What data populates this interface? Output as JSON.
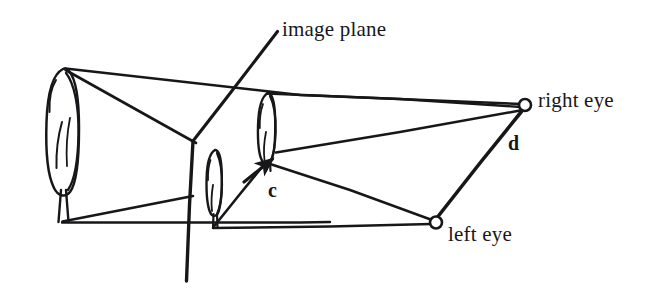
{
  "figure": {
    "domain": "Diagram",
    "background_color": "#ffffff",
    "ink_color": "#17171a",
    "width": 667,
    "height": 289
  },
  "labels": {
    "image_plane": "image plane",
    "right_eye": "right eye",
    "left_eye": "left eye",
    "vector_c": "c",
    "vector_d": "d"
  },
  "icons": {
    "right_eye_marker": "circle-node-icon",
    "left_eye_marker": "circle-node-icon",
    "arrow_c": "arrow-icon",
    "tree_far": "tree-icon",
    "tree_mid": "tree-icon",
    "tree_near": "tree-icon",
    "image_plane_line": "plane-line-icon"
  },
  "geometry": {
    "right_eye": {
      "x": 525,
      "y": 105,
      "r": 6
    },
    "left_eye": {
      "x": 436,
      "y": 222,
      "r": 6
    },
    "image_plane": {
      "top": {
        "x": 277,
        "y": 32
      },
      "bend": {
        "x": 193,
        "y": 141
      },
      "bottom": {
        "x": 186,
        "y": 281
      }
    },
    "tree_far": {
      "top_x": 63,
      "top_y": 69,
      "base_x": 63,
      "base_y": 223
    },
    "tree_mid": {
      "top_x": 268,
      "top_y": 93,
      "base_x": 268,
      "base_y": 162
    },
    "tree_near": {
      "top_x": 215,
      "top_y": 150,
      "base_x": 215,
      "base_y": 228
    },
    "c_arrow": {
      "tail_x": 244,
      "tail_y": 182,
      "head_x": 277,
      "head_y": 155
    },
    "d_segment": {
      "from_x": 436,
      "from_y": 222,
      "to_x": 521,
      "to_y": 112
    }
  }
}
